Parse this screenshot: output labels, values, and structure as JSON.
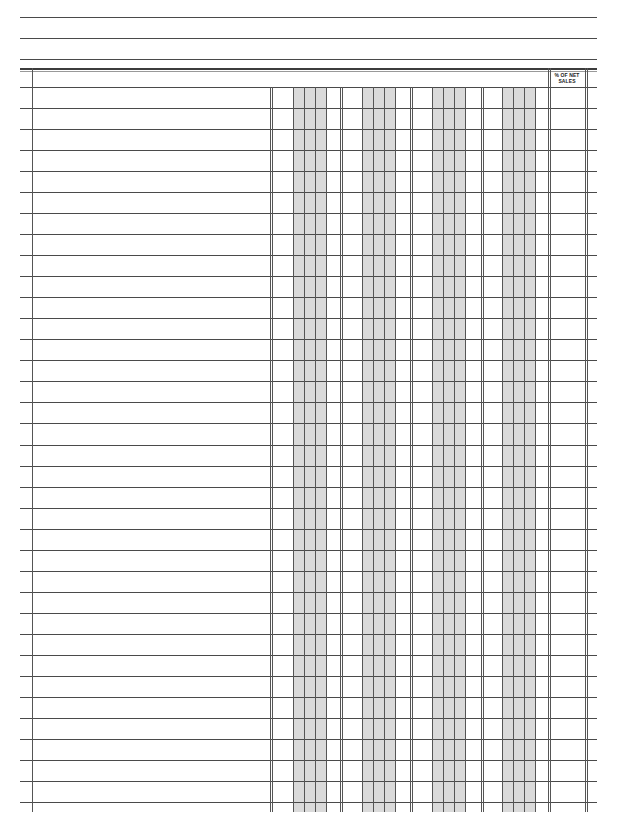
{
  "form": {
    "type": "columnar-ledger",
    "header_lines": 3,
    "row_count": 34,
    "money_columns": 4,
    "percent_column_header_line1": "% OF NET",
    "percent_column_header_line2": "SALES"
  },
  "colors": {
    "line": "#4a4a4a",
    "shade": "#dadada",
    "background": "#ffffff"
  }
}
